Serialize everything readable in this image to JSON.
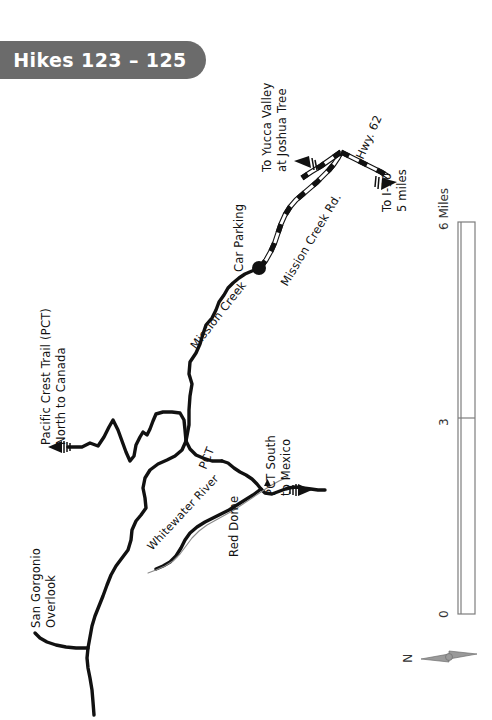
{
  "banner": {
    "title": "Hikes 123 – 125"
  },
  "map": {
    "labels": {
      "to_yucca_valley": "To Yucca Valley",
      "at_joshua_tree": "at Joshua Tree",
      "hwy_62": "Hwy. 62",
      "to_i10": "To I-10",
      "i10_distance": "5 miles",
      "car_parking": "Car Parking",
      "mission_creek_rd": "Mission Creek Rd.",
      "mission_creek": "Mission Creek",
      "pacific_crest_trail": "Pacific Crest Trail (PCT)",
      "north_to_canada": "North to Canada",
      "pct": "PCT",
      "pct_south": "PCT South",
      "to_mexico": "to Mexico",
      "whitewater_river": "Whitewater River",
      "red_dome": "Red Dome",
      "san_gorgonio": "San Gorgonio",
      "overlook": "Overlook"
    },
    "scale_bar": {
      "ticks": [
        "0",
        "3",
        "6 Miles"
      ]
    },
    "compass": {
      "north_label": "N"
    },
    "colors": {
      "banner_background": "#6b6b6b",
      "banner_text": "#ffffff",
      "trail": "#111111",
      "river": "#8a8a8a",
      "scale": "#7d7d7d",
      "background": "#ffffff"
    }
  }
}
